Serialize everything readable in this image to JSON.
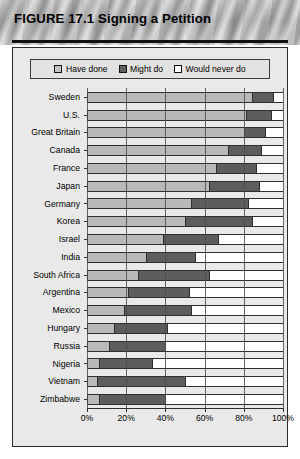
{
  "header": {
    "title": "FIGURE 17.1  Signing a Petition"
  },
  "legend": {
    "items": [
      {
        "label": "Have done",
        "color": "#c2c2c2",
        "key": "have_done"
      },
      {
        "label": "Might do",
        "color": "#5f5f5f",
        "key": "might_do"
      },
      {
        "label": "Would never do",
        "color": "#ffffff",
        "key": "would_never_do"
      }
    ]
  },
  "axis": {
    "ticks": [
      "0%",
      "20%",
      "40%",
      "60%",
      "80%",
      "100%"
    ],
    "tick_values": [
      0,
      20,
      40,
      60,
      80,
      100
    ]
  },
  "chart_data": {
    "type": "bar",
    "orientation": "horizontal",
    "stacked": true,
    "title": "FIGURE 17.1  Signing a Petition",
    "xlabel": "",
    "ylabel": "",
    "xlim": [
      0,
      100
    ],
    "grid": true,
    "legend_position": "top",
    "categories": [
      "Sweden",
      "U.S.",
      "Great Britain",
      "Canada",
      "France",
      "Japan",
      "Germany",
      "Korea",
      "Israel",
      "India",
      "South Africa",
      "Argentina",
      "Mexico",
      "Hungary",
      "Russia",
      "Nigeria",
      "Vietnam",
      "Zimbabwe"
    ],
    "series": [
      {
        "name": "Have done",
        "color": "#b9b9b9",
        "values": [
          84,
          81,
          80,
          72,
          66,
          62,
          53,
          50,
          39,
          30,
          26,
          21,
          19,
          14,
          11,
          6,
          5,
          6
        ]
      },
      {
        "name": "Might do",
        "color": "#5d5d5d",
        "values": [
          11,
          13,
          11,
          17,
          20,
          26,
          29,
          34,
          28,
          25,
          36,
          31,
          34,
          27,
          29,
          27,
          45,
          34
        ]
      },
      {
        "name": "Would never do",
        "color": "#ffffff",
        "values": [
          5,
          6,
          9,
          11,
          14,
          12,
          18,
          16,
          33,
          45,
          38,
          48,
          47,
          59,
          60,
          67,
          50,
          60
        ]
      }
    ]
  }
}
